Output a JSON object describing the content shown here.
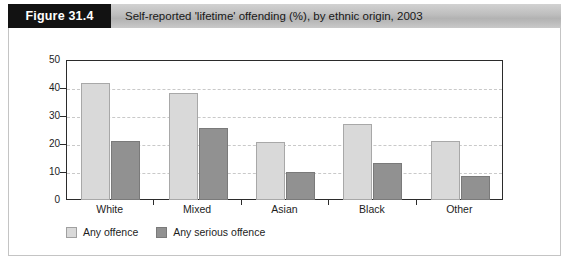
{
  "header": {
    "figure_number": "Figure 31.4",
    "title": "Self-reported 'lifetime' offending (%), by ethnic origin, 2003"
  },
  "colors": {
    "series_light": "#d9d9d9",
    "series_dark": "#919191",
    "figure_block": "#121212",
    "header_bar": "#bdbdbd",
    "axis": "#2b2b2b",
    "gridline": "#c9c9c9"
  },
  "chart_data": {
    "type": "bar",
    "title": "Self-reported 'lifetime' offending (%), by ethnic origin, 2003",
    "xlabel": "",
    "ylabel": "",
    "categories": [
      "White",
      "Mixed",
      "Asian",
      "Black",
      "Other"
    ],
    "series": [
      {
        "name": "Any offence",
        "values": [
          42,
          38.5,
          21,
          27.5,
          21.5
        ]
      },
      {
        "name": "Any serious offence",
        "values": [
          21.5,
          26,
          10.5,
          13.5,
          9
        ]
      }
    ],
    "ylim": [
      0,
      50
    ],
    "yticks": [
      0,
      10,
      20,
      30,
      40,
      50
    ],
    "ytick_labels": [
      "0",
      "10",
      "20",
      "30",
      "40",
      "50"
    ],
    "grid": true,
    "legend_position": "bottom-left"
  }
}
